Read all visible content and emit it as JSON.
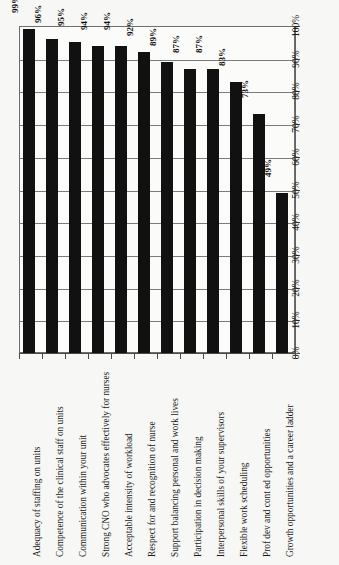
{
  "chart_data": {
    "type": "bar",
    "title": "",
    "xlabel": "",
    "ylabel": "",
    "ylim": [
      0,
      100
    ],
    "grid": true,
    "orientation": "vertical-bars-rotated-labels",
    "legend": "none",
    "categories": [
      "Adequacy of staffing on units",
      "Competence of the clinical staff on units",
      "Communication within your unit",
      "Strong CNO who advocates effectively for nurses",
      "Acceptable intensity of workload",
      "Respect for and recognition of nurse",
      "Support balancing personal and work lives",
      "Participation in decision making",
      "Interpersonal skills of your supervisors",
      "Flexible work scheduling",
      "Prof dev and cont ed opportunities",
      "Growth opportunities and a career ladder"
    ],
    "values": [
      99,
      96,
      95,
      94,
      94,
      92,
      89,
      87,
      87,
      83,
      73,
      49
    ],
    "value_labels": [
      "99%",
      "96%",
      "95%",
      "94%",
      "94%",
      "92%",
      "89%",
      "87%",
      "87%",
      "83%",
      "73%",
      "49%"
    ],
    "tick_labels": [
      "0%",
      "10%",
      "20%",
      "30%",
      "40%",
      "50%",
      "60%",
      "70%",
      "80%",
      "90%",
      "100%"
    ],
    "tick_values": [
      0,
      10,
      20,
      30,
      40,
      50,
      60,
      70,
      80,
      90,
      100
    ],
    "bar_color": "#111111",
    "plot_background": "#fbfbf9",
    "grid_color": "#7b7b7b"
  }
}
